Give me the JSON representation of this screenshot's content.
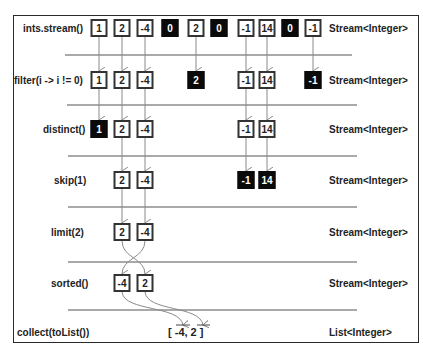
{
  "diagram": {
    "stages": [
      {
        "operation": "ints.stream()",
        "type": "Stream<Integer>",
        "elements": [
          {
            "value": "1",
            "dropped": false
          },
          {
            "value": "2",
            "dropped": false
          },
          {
            "value": "-4",
            "dropped": false
          },
          {
            "value": "0",
            "dropped": true
          },
          {
            "value": "2",
            "dropped": false
          },
          {
            "value": "0",
            "dropped": true
          },
          {
            "value": "-1",
            "dropped": false
          },
          {
            "value": "14",
            "dropped": false
          },
          {
            "value": "0",
            "dropped": true
          },
          {
            "value": "-1",
            "dropped": false
          }
        ]
      },
      {
        "operation": "filter(i -> i != 0)",
        "type": "Stream<Integer>",
        "elements": [
          {
            "value": "1",
            "dropped": false
          },
          {
            "value": "2",
            "dropped": false
          },
          {
            "value": "-4",
            "dropped": false
          },
          {
            "value": "2",
            "dropped": true
          },
          {
            "value": "-1",
            "dropped": false
          },
          {
            "value": "14",
            "dropped": false
          },
          {
            "value": "-1",
            "dropped": true
          }
        ]
      },
      {
        "operation": "distinct()",
        "type": "Stream<Integer>",
        "elements": [
          {
            "value": "1",
            "dropped": true
          },
          {
            "value": "2",
            "dropped": false
          },
          {
            "value": "-4",
            "dropped": false
          },
          {
            "value": "-1",
            "dropped": false
          },
          {
            "value": "14",
            "dropped": false
          }
        ]
      },
      {
        "operation": "skip(1)",
        "type": "Stream<Integer>",
        "elements": [
          {
            "value": "2",
            "dropped": false
          },
          {
            "value": "-4",
            "dropped": false
          },
          {
            "value": "-1",
            "dropped": true
          },
          {
            "value": "14",
            "dropped": true
          }
        ]
      },
      {
        "operation": "limit(2)",
        "type": "Stream<Integer>",
        "elements": [
          {
            "value": "2",
            "dropped": false
          },
          {
            "value": "-4",
            "dropped": false
          }
        ]
      },
      {
        "operation": "sorted()",
        "type": "Stream<Integer>",
        "elements": [
          {
            "value": "-4",
            "dropped": false
          },
          {
            "value": "2",
            "dropped": false
          }
        ]
      },
      {
        "operation": "collect(toList())",
        "type": "List<Integer>",
        "result": "[ -4, 2 ]"
      }
    ],
    "colors": {
      "frame": "#2a2a2a",
      "box_border": "#333333",
      "dropped_fill": "#0a0a0a",
      "arrow": "#8a8a8a",
      "separator": "#555555"
    }
  }
}
